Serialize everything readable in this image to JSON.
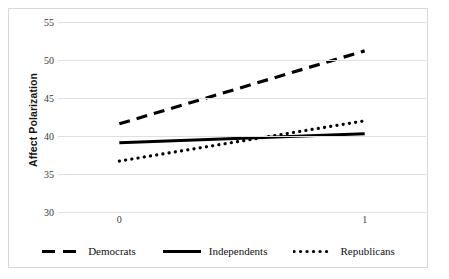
{
  "chart_data": {
    "type": "line",
    "title": "",
    "subtitle": "",
    "xlabel": "",
    "ylabel": "Affect Polarization",
    "x": [
      0,
      1
    ],
    "x_tick_labels": [
      "0",
      "1"
    ],
    "xlim": [
      -0.25,
      1.25
    ],
    "y_tick_labels": [
      "55",
      "50",
      "45",
      "40",
      "35",
      "30"
    ],
    "y_ticks": [
      55,
      50,
      45,
      40,
      35,
      30
    ],
    "ylim": [
      30,
      55
    ],
    "grid": "horizontal",
    "legend_position": "bottom",
    "series": [
      {
        "name": "Democrats",
        "style": "dashed",
        "color": "#000000",
        "values": [
          41.6,
          51.2
        ]
      },
      {
        "name": "Independents",
        "style": "solid",
        "color": "#000000",
        "values": [
          39.1,
          40.3
        ]
      },
      {
        "name": "Republicans",
        "style": "dotted",
        "color": "#000000",
        "values": [
          36.7,
          42.0
        ]
      }
    ]
  },
  "axis": {
    "y_title": "Affect Polarization",
    "y_tick_labels": [
      "55",
      "50",
      "45",
      "40",
      "35",
      "30"
    ],
    "x_tick_labels": [
      "0",
      "1"
    ]
  },
  "legend": {
    "items": [
      {
        "label": "Democrats",
        "style": "dashed"
      },
      {
        "label": "Independents",
        "style": "solid"
      },
      {
        "label": "Republicans",
        "style": "dotted"
      }
    ]
  },
  "colors": {
    "series": "#000000",
    "gridline": "#dfdfdf",
    "frame": "#d8d8d8",
    "tick_text": "#3a3a3a",
    "axis_title": "#161616"
  }
}
